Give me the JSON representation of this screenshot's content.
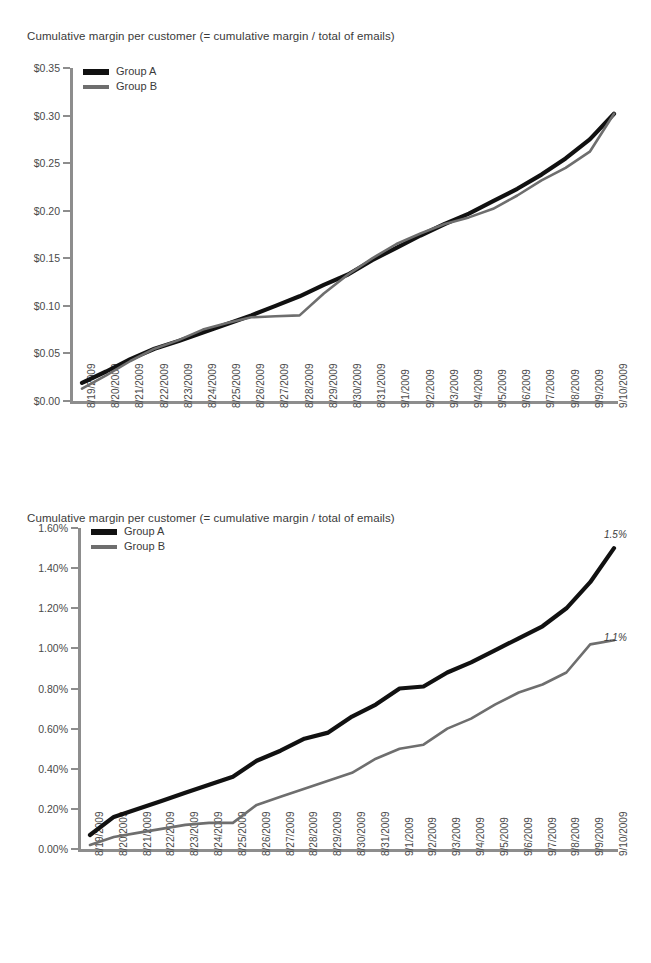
{
  "charts": [
    {
      "id": "chart-top",
      "title": "Cumulative margin per customer (= cumulative margin / total of emails)",
      "legend": [
        {
          "label": "Group A",
          "color": "#111111"
        },
        {
          "label": "Group B",
          "color": "#6e6e6e"
        }
      ]
    },
    {
      "id": "chart-bottom",
      "title": "Cumulative margin per customer (= cumulative margin / total of emails)",
      "legend": [
        {
          "label": "Group A",
          "color": "#111111"
        },
        {
          "label": "Group B",
          "color": "#6e6e6e"
        }
      ],
      "annotations": [
        {
          "text": "1.5%",
          "series": "Group A"
        },
        {
          "text": "1.1%",
          "series": "Group B"
        }
      ]
    }
  ],
  "chart_data": [
    {
      "type": "line",
      "title": "Cumulative margin per customer (= cumulative margin / total of emails)",
      "xlabel": "",
      "ylabel": "",
      "ylim": [
        0,
        0.35
      ],
      "ytick_labels": [
        "$0.00",
        "$0.05",
        "$0.10",
        "$0.15",
        "$0.20",
        "$0.25",
        "$0.30",
        "$0.35"
      ],
      "ytick_values": [
        0,
        0.05,
        0.1,
        0.15,
        0.2,
        0.25,
        0.3,
        0.35
      ],
      "grid": false,
      "legend_position": "top-left",
      "categories": [
        "8/19/2009",
        "8/20/2009",
        "8/21/2009",
        "8/22/2009",
        "8/23/2009",
        "8/24/2009",
        "8/25/2009",
        "8/26/2009",
        "8/27/2009",
        "8/28/2009",
        "8/29/2009",
        "8/30/2009",
        "8/31/2009",
        "9/1/2009",
        "9/2/2009",
        "9/3/2009",
        "9/4/2009",
        "9/5/2009",
        "9/6/2009",
        "9/7/2009",
        "9/8/2009",
        "9/9/2009",
        "9/10/2009"
      ],
      "series": [
        {
          "name": "Group A",
          "color": "#111111",
          "values": [
            0.019,
            0.031,
            0.044,
            0.055,
            0.063,
            0.072,
            0.081,
            0.09,
            0.1,
            0.11,
            0.122,
            0.133,
            0.148,
            0.161,
            0.174,
            0.186,
            0.197,
            0.21,
            0.223,
            0.238,
            0.255,
            0.275,
            0.302
          ]
        },
        {
          "name": "Group B",
          "color": "#6e6e6e",
          "values": [
            0.013,
            0.027,
            0.042,
            0.055,
            0.064,
            0.075,
            0.082,
            0.088,
            0.089,
            0.09,
            0.113,
            0.133,
            0.15,
            0.165,
            0.176,
            0.186,
            0.193,
            0.202,
            0.216,
            0.232,
            0.245,
            0.262,
            0.302
          ]
        }
      ]
    },
    {
      "type": "line",
      "title": "Cumulative margin per customer (= cumulative margin / total of emails)",
      "xlabel": "",
      "ylabel": "",
      "ylim": [
        0,
        1.6
      ],
      "unit": "%",
      "ytick_labels": [
        "0.00%",
        "0.20%",
        "0.40%",
        "0.60%",
        "0.80%",
        "1.00%",
        "1.20%",
        "1.40%",
        "1.60%"
      ],
      "ytick_values": [
        0,
        0.2,
        0.4,
        0.6,
        0.8,
        1.0,
        1.2,
        1.4,
        1.6
      ],
      "grid": false,
      "legend_position": "top-left",
      "categories": [
        "8/19/2009",
        "8/20/2009",
        "8/21/2009",
        "8/22/2009",
        "8/23/2009",
        "8/24/2009",
        "8/25/2009",
        "8/26/2009",
        "8/27/2009",
        "8/28/2009",
        "8/29/2009",
        "8/30/2009",
        "8/31/2009",
        "9/1/2009",
        "9/2/2009",
        "9/3/2009",
        "9/4/2009",
        "9/5/2009",
        "9/6/2009",
        "9/7/2009",
        "9/8/2009",
        "9/9/2009",
        "9/10/2009"
      ],
      "series": [
        {
          "name": "Group A",
          "color": "#111111",
          "end_label": "1.5%",
          "values": [
            0.07,
            0.16,
            0.2,
            0.24,
            0.28,
            0.32,
            0.36,
            0.44,
            0.49,
            0.55,
            0.58,
            0.66,
            0.72,
            0.8,
            0.81,
            0.88,
            0.93,
            0.99,
            1.05,
            1.11,
            1.2,
            1.33,
            1.5
          ]
        },
        {
          "name": "Group B",
          "color": "#6e6e6e",
          "end_label": "1.1%",
          "values": [
            0.02,
            0.06,
            0.08,
            0.1,
            0.12,
            0.13,
            0.13,
            0.22,
            0.26,
            0.3,
            0.34,
            0.38,
            0.45,
            0.5,
            0.52,
            0.6,
            0.65,
            0.72,
            0.78,
            0.82,
            0.88,
            1.02,
            1.04
          ]
        }
      ]
    }
  ]
}
